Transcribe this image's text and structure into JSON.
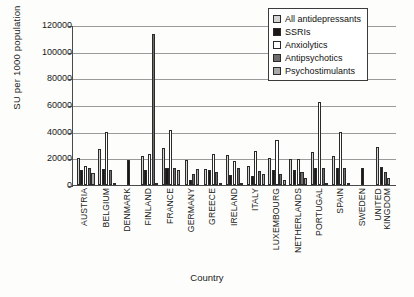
{
  "chart_data": {
    "type": "bar",
    "title": "",
    "xlabel": "Country",
    "ylabel": "SU per 1000 population",
    "ylim": [
      0,
      120000
    ],
    "ytick_step": 20000,
    "yticks": [
      "120000",
      "100000",
      "80000",
      "60000",
      "40000",
      "20000",
      "0"
    ],
    "grid": true,
    "legend_position": "top-right",
    "categories": [
      "AUSTRIA",
      "BELGIUM",
      "DENMARK",
      "FINLAND",
      "FRANCE",
      "GERMANY",
      "GREECE",
      "IRELAND",
      "ITALY",
      "LUXEMBOURG",
      "NETHERLANDS",
      "PORTUGAL",
      "SPAIN",
      "SWEDEN",
      "UNITED KINGDOM"
    ],
    "series": [
      {
        "name": "All antidepressants",
        "color": "#d4d4d4",
        "values": [
          20000,
          27000,
          0,
          21500,
          28000,
          19000,
          12000,
          22500,
          14000,
          20000,
          19500,
          25000,
          21500,
          0,
          28500
        ]
      },
      {
        "name": "SSRIs",
        "color": "#1c1716",
        "values": [
          11000,
          12000,
          19000,
          11000,
          13000,
          4000,
          11500,
          7500,
          7000,
          11000,
          11000,
          13000,
          13000,
          13000,
          13500
        ]
      },
      {
        "name": "Anxiolytics",
        "color": "#ffffff",
        "values": [
          14500,
          40000,
          0,
          23000,
          41000,
          0,
          23000,
          18000,
          25500,
          34000,
          19500,
          62000,
          40000,
          0,
          0
        ]
      },
      {
        "name": "Antipsychotics",
        "color": "#6d6d6d",
        "values": [
          13000,
          11000,
          0,
          113000,
          12500,
          8500,
          10000,
          13000,
          10500,
          8000,
          10000,
          13000,
          13000,
          0,
          9500
        ]
      },
      {
        "name": "Psychostimulants",
        "color": "#a8a8a8",
        "values": [
          9000,
          1200,
          0,
          1000,
          11500,
          12000,
          1500,
          1200,
          8000,
          4000,
          5000,
          1500,
          1800,
          0,
          5500
        ]
      }
    ]
  },
  "legend": {
    "items": [
      {
        "label": "All antidepressants",
        "color": "#d4d4d4"
      },
      {
        "label": "SSRIs",
        "color": "#1c1716"
      },
      {
        "label": "Anxiolytics",
        "color": "#ffffff"
      },
      {
        "label": "Antipsychotics",
        "color": "#6d6d6d"
      },
      {
        "label": "Psychostimulants",
        "color": "#a8a8a8"
      }
    ]
  }
}
